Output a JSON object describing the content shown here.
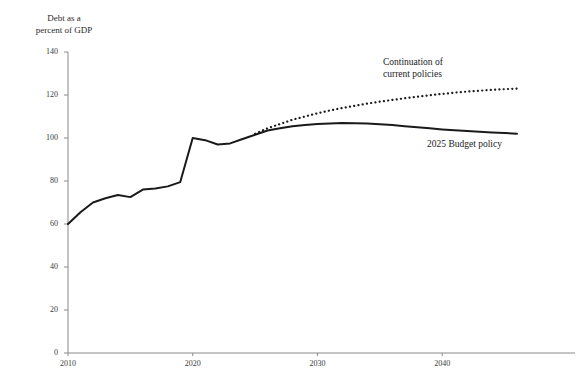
{
  "chart_data": {
    "type": "line",
    "title": "Debt as a\npercent of GDP",
    "xlabel": "",
    "ylabel": "Debt as a percent of GDP",
    "xlim": [
      2010,
      2046
    ],
    "ylim": [
      0,
      140
    ],
    "grid": false,
    "legend_position": "inline-annotation",
    "y_ticks": [
      0,
      20,
      40,
      60,
      80,
      100,
      120,
      140
    ],
    "y_tick_labels": [
      "0",
      "20",
      "40",
      "60",
      "80",
      "100",
      "120",
      "140"
    ],
    "x_ticks": [
      2010,
      2020,
      2030,
      2040
    ],
    "x_tick_labels": [
      "2010",
      "2020",
      "2030",
      "2040"
    ],
    "series": [
      {
        "name": "2025 Budget policy",
        "style": "solid",
        "color": "#1a1a1a",
        "x": [
          2010,
          2011,
          2012,
          2013,
          2014,
          2015,
          2016,
          2017,
          2018,
          2019,
          2020,
          2021,
          2022,
          2023,
          2024,
          2025,
          2026,
          2027,
          2028,
          2029,
          2030,
          2031,
          2032,
          2033,
          2034,
          2035,
          2036,
          2037,
          2038,
          2039,
          2040,
          2041,
          2042,
          2043,
          2044,
          2045,
          2046
        ],
        "values": [
          60.0,
          65.5,
          70.0,
          72.0,
          73.5,
          72.5,
          76.0,
          76.5,
          77.5,
          79.5,
          100.0,
          99.0,
          97.0,
          97.5,
          99.5,
          101.5,
          103.5,
          104.5,
          105.5,
          106.0,
          106.5,
          106.8,
          107.0,
          106.9,
          106.7,
          106.4,
          106.0,
          105.5,
          105.0,
          104.5,
          104.0,
          103.6,
          103.2,
          102.9,
          102.6,
          102.3,
          102.0
        ]
      },
      {
        "name": "Continuation of current policies",
        "style": "dotted",
        "color": "#1a1a1a",
        "x": [
          2025,
          2026,
          2027,
          2028,
          2029,
          2030,
          2031,
          2032,
          2033,
          2034,
          2035,
          2036,
          2037,
          2038,
          2039,
          2040,
          2041,
          2042,
          2043,
          2044,
          2045,
          2046
        ],
        "values": [
          102.0,
          104.5,
          106.5,
          108.5,
          110.0,
          111.5,
          112.8,
          114.0,
          115.0,
          116.0,
          116.9,
          117.7,
          118.5,
          119.2,
          119.9,
          120.5,
          121.1,
          121.6,
          122.0,
          122.4,
          122.7,
          123.0
        ]
      }
    ],
    "annotations": [
      {
        "text": "Continuation of\ncurrent policies",
        "x_px": 383,
        "y_px": 56
      },
      {
        "text": "2025 Budget policy",
        "x_px": 427,
        "y_px": 138
      }
    ]
  }
}
